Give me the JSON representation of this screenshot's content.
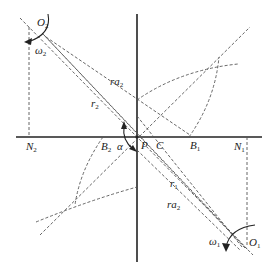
{
  "diagram": {
    "labels": {
      "O2": {
        "base": "O",
        "sub": "2"
      },
      "omega2": {
        "base": "ω",
        "sub": "2"
      },
      "ra2_upper": {
        "base": "ra",
        "sub": "2"
      },
      "r2": {
        "base": "r",
        "sub": "2"
      },
      "N2": {
        "base": "N",
        "sub": "2"
      },
      "B2": {
        "base": "B",
        "sub": "2"
      },
      "alpha": {
        "base": "α",
        "sub": ""
      },
      "P": {
        "base": "P",
        "sub": ""
      },
      "C": {
        "base": "C",
        "sub": ""
      },
      "B1": {
        "base": "B",
        "sub": "1"
      },
      "N1": {
        "base": "N",
        "sub": "1"
      },
      "r1": {
        "base": "r",
        "sub": "1"
      },
      "ra2_lower": {
        "base": "ra",
        "sub": "2"
      },
      "omega1": {
        "base": "ω",
        "sub": "1"
      },
      "O1": {
        "base": "O",
        "sub": "1"
      }
    },
    "colors": {
      "axis": "#222222",
      "dashed": "#555555",
      "background": "#ffffff"
    }
  }
}
